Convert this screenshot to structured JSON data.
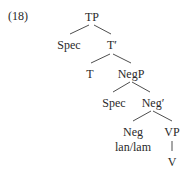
{
  "example_number": "(18)",
  "tree": {
    "nodes": {
      "tp": "TP",
      "spec_tp": "Spec",
      "t_bar": "T′",
      "t": "T",
      "negp": "NegP",
      "spec_negp": "Spec",
      "neg_bar": "Neg′",
      "neg": "Neg",
      "neg_word": "lan/lam",
      "vp": "VP",
      "v": "V"
    },
    "edges": [
      [
        "TP",
        "Spec"
      ],
      [
        "TP",
        "T′"
      ],
      [
        "T′",
        "T"
      ],
      [
        "T′",
        "NegP"
      ],
      [
        "NegP",
        "Spec"
      ],
      [
        "NegP",
        "Neg′"
      ],
      [
        "Neg′",
        "Neg"
      ],
      [
        "Neg′",
        "VP"
      ],
      [
        "Neg",
        "lan/lam"
      ],
      [
        "VP",
        "V"
      ]
    ]
  },
  "colors": {
    "text": "#2a2a2a",
    "lines": "#3a3a3a",
    "background": "#ffffff"
  }
}
